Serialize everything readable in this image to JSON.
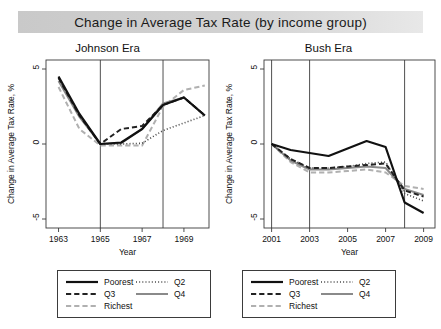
{
  "figure": {
    "title": "Change in Average Tax Rate (by income group)",
    "axis_x_label": "Year",
    "axis_y_label": "Change in Average Tax Rate, %",
    "background": "#ffffff",
    "title_band_color": "#d2d2d2"
  },
  "legend": {
    "entries": [
      {
        "label": "Poorest",
        "style": "solid",
        "color": "#111111",
        "width": 2.2
      },
      {
        "label": "Q2",
        "style": "dotted",
        "color": "#444444",
        "width": 1.6
      },
      {
        "label": "Q3",
        "style": "dashed",
        "color": "#222222",
        "width": 2.0
      },
      {
        "label": "Q4",
        "style": "solid",
        "color": "#8a8a8a",
        "width": 2.0
      },
      {
        "label": "Richest",
        "style": "dashed",
        "color": "#b0b0b0",
        "width": 2.0
      }
    ],
    "order_display": [
      [
        "Poorest",
        "Q2"
      ],
      [
        "Q3",
        "Q4"
      ],
      [
        "Richest",
        ""
      ]
    ]
  },
  "chart_data": [
    {
      "type": "line",
      "title": "Johnson Era",
      "xlabel": "Year",
      "ylabel": "Change in Average Tax Rate, %",
      "xlim": [
        1962.4,
        1970.2
      ],
      "ylim": [
        -5.6,
        5.6
      ],
      "xticks": [
        1963,
        1965,
        1967,
        1969
      ],
      "yticks": [
        5,
        0,
        -5
      ],
      "grid": false,
      "vlines": [
        1965,
        1968
      ],
      "legend_position": "below",
      "x": [
        1963,
        1964,
        1965,
        1966,
        1967,
        1968,
        1969,
        1970
      ],
      "series": [
        {
          "name": "Poorest",
          "style": "solid",
          "color": "#111111",
          "values": [
            4.5,
            2.0,
            0.0,
            0.1,
            1.0,
            2.6,
            3.1,
            1.9
          ]
        },
        {
          "name": "Q2",
          "style": "dotted",
          "color": "#444444",
          "values": [
            4.4,
            1.9,
            0.0,
            0.0,
            0.05,
            0.9,
            1.4,
            1.9
          ]
        },
        {
          "name": "Q3",
          "style": "dashed",
          "color": "#222222",
          "values": [
            4.4,
            1.9,
            0.0,
            1.0,
            1.2,
            2.6,
            3.1,
            1.9
          ]
        },
        {
          "name": "Q4",
          "style": "solid",
          "color": "#8a8a8a",
          "values": [
            4.2,
            1.8,
            0.0,
            0.05,
            1.0,
            2.7,
            3.1,
            1.9
          ]
        },
        {
          "name": "Richest",
          "style": "dashed",
          "color": "#b0b0b0",
          "values": [
            3.8,
            1.0,
            -0.1,
            -0.1,
            -0.1,
            2.5,
            3.6,
            3.9
          ]
        }
      ]
    },
    {
      "type": "line",
      "title": "Bush Era",
      "xlabel": "Year",
      "ylabel": "Change in Average Tax Rate, %",
      "xlim": [
        2000.6,
        2009.6
      ],
      "ylim": [
        -5.6,
        5.6
      ],
      "xticks": [
        2001,
        2003,
        2005,
        2007,
        2009
      ],
      "yticks": [
        5,
        0,
        -5
      ],
      "grid": false,
      "vlines": [
        2001,
        2003,
        2008
      ],
      "legend_position": "below",
      "x": [
        2001,
        2002,
        2003,
        2004,
        2005,
        2006,
        2007,
        2008,
        2009
      ],
      "series": [
        {
          "name": "Poorest",
          "style": "solid",
          "color": "#111111",
          "values": [
            0.0,
            -0.4,
            -0.6,
            -0.8,
            -0.3,
            0.2,
            -0.2,
            -3.9,
            -4.6
          ]
        },
        {
          "name": "Q2",
          "style": "dotted",
          "color": "#444444",
          "values": [
            0.0,
            -1.0,
            -1.6,
            -1.6,
            -1.5,
            -1.3,
            -1.2,
            -3.3,
            -3.8
          ]
        },
        {
          "name": "Q3",
          "style": "dashed",
          "color": "#222222",
          "values": [
            0.0,
            -1.0,
            -1.6,
            -1.6,
            -1.5,
            -1.4,
            -1.3,
            -3.1,
            -3.5
          ]
        },
        {
          "name": "Q4",
          "style": "solid",
          "color": "#8a8a8a",
          "values": [
            0.0,
            -1.1,
            -1.7,
            -1.7,
            -1.6,
            -1.5,
            -1.6,
            -3.0,
            -3.4
          ]
        },
        {
          "name": "Richest",
          "style": "dashed",
          "color": "#b0b0b0",
          "values": [
            0.0,
            -1.2,
            -1.9,
            -1.9,
            -1.8,
            -1.7,
            -1.9,
            -2.8,
            -3.0
          ]
        }
      ]
    }
  ]
}
